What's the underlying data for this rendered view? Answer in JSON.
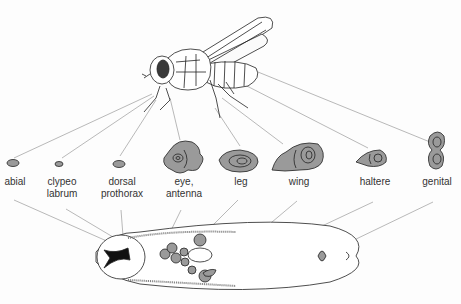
{
  "figure": {
    "adult": "fly",
    "larva": "larva with imaginal discs"
  },
  "discs": [
    {
      "id": "labial",
      "label_line1": "abial",
      "label_line2": "",
      "x": 14,
      "y": 192
    },
    {
      "id": "clypeolabrum",
      "label_line1": "clypeo",
      "label_line2": "labrum",
      "x": 60,
      "y": 192
    },
    {
      "id": "dorsal-prothorax",
      "label_line1": "dorsal",
      "label_line2": "prothorax",
      "x": 122,
      "y": 192
    },
    {
      "id": "eye-antenna",
      "label_line1": "eye,",
      "label_line2": "antenna",
      "x": 184,
      "y": 192
    },
    {
      "id": "leg",
      "label_line1": "leg",
      "label_line2": "",
      "x": 241,
      "y": 192
    },
    {
      "id": "wing",
      "label_line1": "wing",
      "label_line2": "",
      "x": 298,
      "y": 192
    },
    {
      "id": "haltere",
      "label_line1": "haltere",
      "label_line2": "",
      "x": 375,
      "y": 192
    },
    {
      "id": "genital",
      "label_line1": "genital",
      "label_line2": "",
      "x": 437,
      "y": 192
    }
  ],
  "colors": {
    "disc_fill": "#9a9a9a",
    "line": "#777777",
    "ink": "#222222"
  }
}
